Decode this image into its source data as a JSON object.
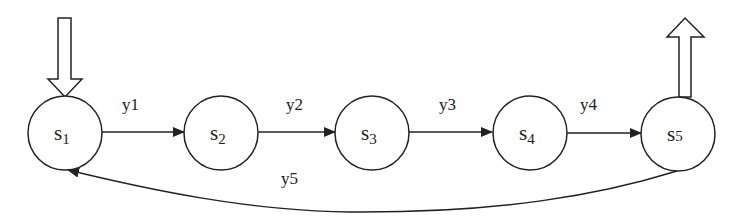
{
  "diagram": {
    "type": "state-machine",
    "stroke_color": "#222222",
    "background": "#ffffff",
    "states": [
      {
        "id": "s1",
        "base": "s",
        "sub": "1",
        "cx": 65,
        "cy": 133,
        "r": 37
      },
      {
        "id": "s2",
        "base": "s",
        "sub": "2",
        "cx": 221,
        "cy": 133,
        "r": 37
      },
      {
        "id": "s3",
        "base": "s",
        "sub": "3",
        "cx": 372,
        "cy": 133,
        "r": 37
      },
      {
        "id": "s4",
        "base": "s",
        "sub": "4",
        "cx": 530,
        "cy": 133,
        "r": 37
      },
      {
        "id": "s5",
        "base": "s",
        "sub": "5",
        "cx": 678,
        "cy": 134,
        "r": 37
      }
    ],
    "transitions": [
      {
        "from": "s1",
        "to": "s2",
        "label": "y1"
      },
      {
        "from": "s2",
        "to": "s3",
        "label": "y2"
      },
      {
        "from": "s3",
        "to": "s4",
        "label": "y3"
      },
      {
        "from": "s4",
        "to": "s5",
        "label": "y4"
      },
      {
        "from": "s5",
        "to": "s1",
        "label": "y5"
      }
    ],
    "entry_arrow": {
      "target": "s1",
      "direction": "down"
    },
    "exit_arrow": {
      "source": "s5",
      "direction": "up"
    }
  }
}
